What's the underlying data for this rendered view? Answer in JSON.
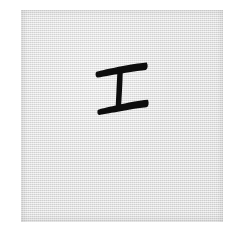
{
  "image": {
    "width": 242,
    "height": 235,
    "background_color": "#ffffff",
    "description": "Scan of a handwritten ink character on a light grey paper swatch"
  },
  "paper": {
    "name": "paper-swatch",
    "x": 21,
    "y": 10,
    "width": 202,
    "height": 212,
    "fill_color": "#dcdcdc",
    "texture": "woven-paper-noise",
    "edge_shadow_color": "#acacac"
  },
  "glyph": {
    "character": "工",
    "romanization": "gong",
    "reading_alt": "I",
    "script": "handwritten-brush-ink",
    "ink_color": "#0d0d0d",
    "bbox": {
      "x": 96,
      "y": 62,
      "width": 52,
      "height": 49
    },
    "strokes": [
      {
        "name": "top-horizontal-stroke",
        "order": 1,
        "type": "horizontal",
        "start": [
          96,
          71
        ],
        "end": [
          147,
          63
        ],
        "max_thickness": 7,
        "min_thickness": 2,
        "taper": "left-thin-right-blunt"
      },
      {
        "name": "vertical-stroke",
        "order": 2,
        "type": "vertical",
        "start": [
          120,
          69
        ],
        "end": [
          119,
          107
        ],
        "max_thickness": 6,
        "min_thickness": 4,
        "taper": "even"
      },
      {
        "name": "bottom-horizontal-stroke",
        "order": 3,
        "type": "horizontal",
        "start": [
          98,
          110
        ],
        "end": [
          148,
          100
        ],
        "max_thickness": 7,
        "min_thickness": 2,
        "taper": "left-thin-right-blunt"
      }
    ],
    "stroke_count": 3
  }
}
